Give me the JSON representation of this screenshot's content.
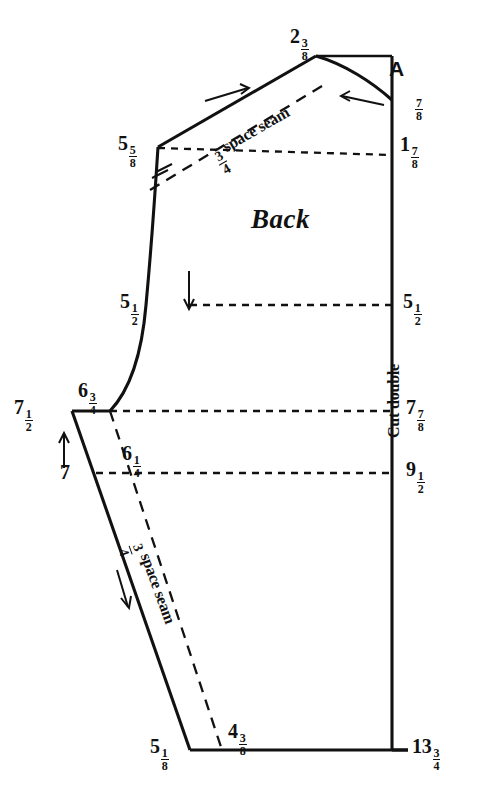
{
  "figure": {
    "piece_label": "Back",
    "point_label_a": "A",
    "grainline_note": "Cut double",
    "seam_note_shoulder": "¾ space seam",
    "seam_note_side": "¾ space seam",
    "ink_color": "#111111",
    "paper_color": "#ffffff"
  },
  "measurements": {
    "neck_apex": {
      "whole": "2",
      "num": "3",
      "den": "8",
      "text": "2 3/8"
    },
    "shoulder_point": {
      "whole": "5",
      "num": "5",
      "den": "8",
      "text": "5 5/8"
    },
    "center_back_neck_drop": {
      "whole": "",
      "num": "7",
      "den": "8",
      "text": "7/8"
    },
    "center_back_upper": {
      "whole": "1",
      "num": "7",
      "den": "8",
      "text": "1 7/8"
    },
    "armhole_left": {
      "whole": "5",
      "num": "1",
      "den": "2",
      "text": "5 1/2"
    },
    "armhole_right": {
      "whole": "5",
      "num": "1",
      "den": "2",
      "text": "5 1/2"
    },
    "underarm_outer": {
      "whole": "7",
      "num": "1",
      "den": "2",
      "text": "7 1/2"
    },
    "underarm_inner": {
      "whole": "6",
      "num": "3",
      "den": "4",
      "text": "6 3/4"
    },
    "underarm_center_back": {
      "whole": "7",
      "num": "7",
      "den": "8",
      "text": "7 7/8"
    },
    "waist_left": {
      "whole": "7",
      "num": "",
      "den": "",
      "text": "7"
    },
    "waist_inner": {
      "whole": "6",
      "num": "1",
      "den": "4",
      "text": "6 1/4"
    },
    "waist_center_back": {
      "whole": "9",
      "num": "1",
      "den": "2",
      "text": "9 1/2"
    },
    "hem_left": {
      "whole": "5",
      "num": "1",
      "den": "8",
      "text": "5 1/8"
    },
    "hem_inner": {
      "whole": "4",
      "num": "3",
      "den": "8",
      "text": "4 3/8"
    },
    "hem_center_back": {
      "whole": "13",
      "num": "3",
      "den": "4",
      "text": "13 3/4"
    }
  },
  "seam_fraction": {
    "num": "3",
    "den": "4",
    "text": "¾"
  },
  "seam_words": "space seam",
  "icons": {
    "arrow_right": "arrow-right-icon",
    "arrow_left": "arrow-left-icon",
    "arrow_down": "arrow-down-icon",
    "arrow_up": "arrow-up-icon",
    "arrow_down_side": "arrow-down-side-icon"
  }
}
